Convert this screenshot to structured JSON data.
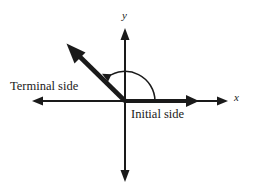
{
  "figure": {
    "type": "angle-in-standard-position-diagram",
    "background_color": "#ffffff",
    "stroke_color": "#1a1a1a",
    "axes": {
      "x_label": "x",
      "y_label": "y",
      "origin": {
        "x": 125,
        "y": 101
      },
      "x_axis": {
        "left_tip": 32,
        "right_tip": 228,
        "y": 101
      },
      "y_axis": {
        "top_tip": 28,
        "bottom_tip": 182,
        "x": 125
      }
    },
    "rays": {
      "initial_side": {
        "label": "Initial side",
        "from": {
          "x": 125,
          "y": 101
        },
        "to": {
          "x": 198,
          "y": 101
        },
        "direction_degrees": 0
      },
      "terminal_side": {
        "label": "Terminal side",
        "from": {
          "x": 125,
          "y": 101
        },
        "to": {
          "x": 68,
          "y": 45
        },
        "direction_degrees": 135
      }
    },
    "angle_arc": {
      "radius": 30,
      "start_degrees": 0,
      "end_degrees": 135,
      "sweep": "counterclockwise",
      "arrow_at": "terminal-end"
    }
  }
}
